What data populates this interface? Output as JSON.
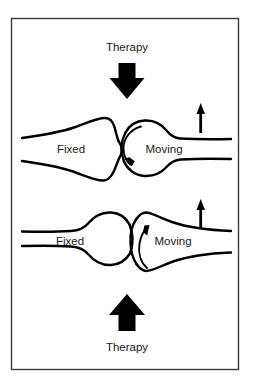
{
  "figure": {
    "title_top": "Therapy",
    "title_bottom": "Therapy",
    "background_color": "#ffffff",
    "ink_color": "#000000",
    "frame_color": "#3a3a3a",
    "panels": [
      {
        "id": "upper",
        "therapy_label": "Therapy",
        "therapy_arrow_direction": "down",
        "fixed_label": "Fixed",
        "moving_label": "Moving",
        "fixed_surface": "concave",
        "moving_surface": "convex",
        "glide_arrow_direction": "counterclockwise-down",
        "motion_arrow_direction": "up"
      },
      {
        "id": "lower",
        "therapy_label": "Therapy",
        "therapy_arrow_direction": "up",
        "fixed_label": "Fixed",
        "moving_label": "Moving",
        "fixed_surface": "convex",
        "moving_surface": "concave",
        "glide_arrow_direction": "up",
        "motion_arrow_direction": "up"
      }
    ]
  }
}
